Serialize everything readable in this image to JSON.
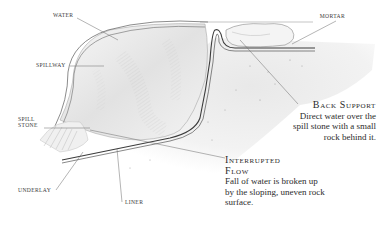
{
  "diagram": {
    "type": "cross-section illustration",
    "labels": {
      "water": "WATER",
      "mortar": "MORTAR",
      "spillway": "SPILLWAY",
      "spill_stone_line1": "SPILL",
      "spill_stone_line2": "STONE",
      "underlay": "UNDERLAY",
      "liner": "LINER"
    },
    "callouts": {
      "back_support": {
        "title": "Back Support",
        "body": "Direct water over the spill stone with a small rock behind it."
      },
      "interrupted_flow": {
        "title_line1": "Interrupted",
        "title_line2": "Flow",
        "body": "Fall of water is broken up by the sloping, uneven rock surface."
      }
    },
    "colors": {
      "line": "#4a4a4a",
      "shade": "#bdbdbd",
      "paper": "#ffffff"
    }
  }
}
